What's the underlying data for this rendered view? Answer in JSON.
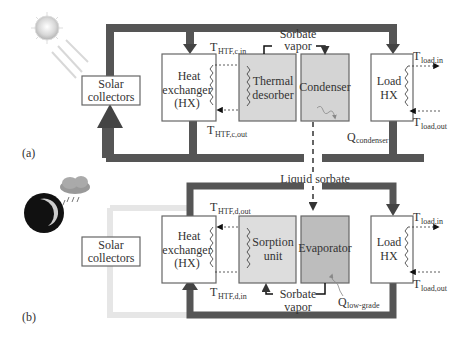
{
  "panel_a": {
    "label": "(a)",
    "solar_collectors": [
      "Solar",
      "collectors"
    ],
    "heat_exchanger": [
      "Heat",
      "exchanger",
      "(HX)"
    ],
    "thermal_desorber": [
      "Thermal",
      "desorber"
    ],
    "condenser": "Condenser",
    "load_hx": [
      "Load",
      "HX"
    ],
    "sorbate_vapor": [
      "Sorbate",
      "vapor"
    ],
    "t_htf_in": {
      "main": "T",
      "sub": "HTF,c,in"
    },
    "t_htf_out": {
      "main": "T",
      "sub": "HTF,c,out"
    },
    "t_load_in": {
      "main": "T",
      "sub": "load,in"
    },
    "t_load_out": {
      "main": "T",
      "sub": "load,out"
    },
    "q": {
      "main": "Q",
      "sub": "condenser"
    },
    "sun_icon": "sun-icon"
  },
  "liquid_sorbate": "Liquid sorbate",
  "panel_b": {
    "label": "(b)",
    "solar_collectors": [
      "Solar",
      "collectors"
    ],
    "heat_exchanger": [
      "Heat",
      "exchanger",
      "(HX)"
    ],
    "sorption_unit": [
      "Sorption",
      "unit"
    ],
    "evaporator": "Evaporator",
    "load_hx": [
      "Load",
      "HX"
    ],
    "sorbate_vapor": [
      "Sorbate",
      "vapor"
    ],
    "t_htf_out": {
      "main": "T",
      "sub": "HTF,d,out"
    },
    "t_htf_in": {
      "main": "T",
      "sub": "HTF,d,in"
    },
    "t_load_in": {
      "main": "T",
      "sub": "load,in"
    },
    "t_load_out": {
      "main": "T",
      "sub": "load,out"
    },
    "q": {
      "main": "Q",
      "sub": "low-grade"
    },
    "moon_icon": "moon-icon",
    "cloud_icon": "rain-cloud-icon"
  },
  "colors": {
    "pipe": "#555555",
    "pipe_inactive": "#e6e6e6",
    "desorber_fill": "#d8d8d8",
    "condenser_fill": "#d4d4d4",
    "sorption_fill": "#dddddd",
    "evaporator_fill": "#bdbdbd"
  }
}
